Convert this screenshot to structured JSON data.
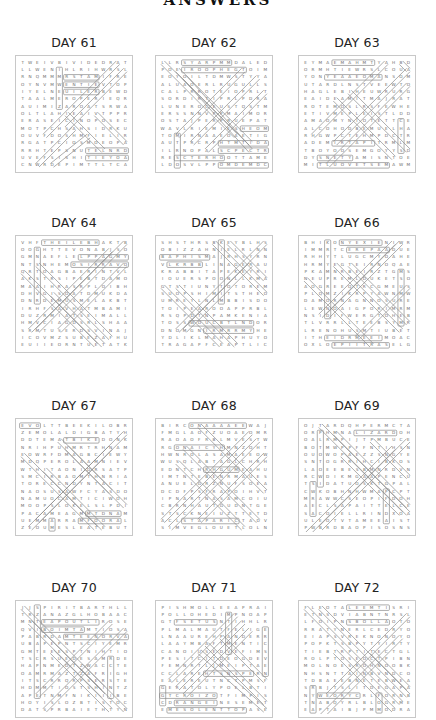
{
  "page": {
    "title": "ANSWERS"
  },
  "puzzles": [
    {
      "day": "DAY 61",
      "rows": [
        "TWEIVBIVIDEDRAT",
        "LLWENIHLRIHWRSL",
        "RNQMMMRSTAMIFRE",
        "OYNVMWENTIEVTOP",
        "IYELNEUILERBEWD",
        "TAALMEROPERIEQR",
        "AUIMIZAROATSRWA",
        "OLTLAHIEAIVTPPR",
        "ERASEICINOPOSEC",
        "MOTPCHSAHSIDRKU",
        "OUVFDOSHMFIELIR",
        "RGATPCIOSMOEOPA",
        "RRHTEPSNUTELNRD",
        "UVEFSISHITIEYOA",
        "CNWRDEPIMTTLTCA"
      ],
      "overlay": {
        "rects": [
          [
            5,
            1,
            5,
            6
          ],
          [
            6,
            2,
            10,
            2
          ],
          [
            6,
            3,
            10,
            3
          ],
          [
            6,
            4,
            10,
            4
          ],
          [
            9,
            12,
            14,
            12
          ],
          [
            9,
            13,
            14,
            13
          ]
        ],
        "diags": [
          [
            14,
            1,
            6,
            9
          ],
          [
            13,
            0,
            3,
            10
          ],
          [
            7,
            9,
            2,
            14
          ],
          [
            9,
            10,
            4,
            14
          ],
          [
            10,
            7,
            14,
            11
          ],
          [
            6,
            7,
            11,
            12
          ]
        ]
      }
    },
    {
      "day": "DAY 62",
      "rows": [
        "LLRSYARPMMDALED",
        "POEIROOPHEGTOIM",
        "EOYOILTDMWSTYYA",
        "ALUAOERLRUGULLS",
        "CALPRROTEIOPRLT",
        "SORDIRTIPRLPDRA",
        "LUNEROCEUSTQSTM",
        "ERSSNNVPPMAIMOR",
        "OSTAJPERPRUEPAT",
        "WAVLRIEMIESHEOM",
        "TOMIRNAAEOAETIG",
        "AUTPRCRPHTMTIDA",
        "ILRNOPALSCPECTR",
        "RESCTERHOOTTAME",
        "LDOSVLPPOMDEMDC"
      ],
      "overlay": {
        "rects": [
          [
            3,
            0,
            9,
            0
          ],
          [
            3,
            1,
            11,
            1
          ],
          [
            11,
            9,
            14,
            9
          ],
          [
            8,
            11,
            14,
            11
          ],
          [
            8,
            12,
            14,
            12
          ],
          [
            2,
            13,
            8,
            13
          ],
          [
            8,
            14,
            14,
            14
          ],
          [
            2,
            10,
            2,
            14
          ]
        ],
        "diags": [
          [
            0,
            0,
            10,
            10
          ],
          [
            2,
            1,
            12,
            11
          ],
          [
            3,
            2,
            12,
            12
          ],
          [
            11,
            1,
            2,
            10
          ],
          [
            13,
            2,
            4,
            11
          ],
          [
            14,
            4,
            6,
            12
          ]
        ]
      }
    },
    {
      "day": "DAY 63",
      "rows": [
        "EYMAEMAHMTYAHBD",
        "ORMHTIEWRSLCOUA",
        "YONYEAAEOMANSOM",
        "UTARDLNSTVEEWTO",
        "HAGLEBIHEUWRURG",
        "EAIDEAMITMAJRAT",
        "ROTEMOSLRSFEWHE",
        "ETIVMEPLEISTLDD",
        "AMAOMYNIOTETTCE",
        "ALCOHODBEMUELHA",
        "RHGWPCTEHMPDCTR",
        "ADEMIRTAPITRMLM",
        "TBOYOOSEMGOYYSD",
        "DYSNETYAMISNTOE",
        "MITLUOVETSEMAWM"
      ],
      "overlay": {
        "rects": [
          [
            4,
            0,
            9,
            0
          ],
          [
            3,
            2,
            10,
            2
          ],
          [
            4,
            11,
            9,
            11
          ],
          [
            2,
            13,
            6,
            13
          ],
          [
            2,
            14,
            11,
            14
          ],
          [
            13,
            8,
            13,
            12
          ]
        ],
        "diags": [
          [
            11,
            0,
            1,
            10
          ],
          [
            14,
            1,
            4,
            11
          ],
          [
            14,
            3,
            3,
            14
          ],
          [
            13,
            0,
            14,
            1
          ],
          [
            6,
            4,
            14,
            12
          ],
          [
            4,
            5,
            12,
            13
          ]
        ]
      }
    },
    {
      "day": "DAY 64",
      "rows": [
        "VHFTHEILEBHAKTB",
        "OOGHTTEVONABJSO",
        "GMNAEFLELPPAGMY",
        "NTSNHEMOSIRRAVO",
        "QRTOAGBAERINTVL",
        "AKSTRSIPEBTDAMO",
        "MAAIHRASRPLOIBH",
        "DHVGISOATDMUKDA",
        "DNRDEMUSMELAKBT",
        "IRHFSAVHATMBAMI",
        "DUZRMIATSEIMALL",
        "HMVCIAGDSRLSHAA",
        "SRMTUSERDSVINAJ",
        "ICOVMZSUBEZAFHU",
        "EUIIEORNTUETATK"
      ],
      "overlay": {
        "rects": [
          [
            3,
            0,
            10,
            0
          ],
          [
            8,
            2,
            14,
            2
          ],
          [
            2,
            1,
            2,
            8
          ],
          [
            7,
            3,
            14,
            3
          ]
        ],
        "diags": [
          [
            14,
            0,
            2,
            12
          ],
          [
            12,
            1,
            1,
            12
          ],
          [
            14,
            3,
            5,
            12
          ],
          [
            0,
            4,
            10,
            14
          ],
          [
            2,
            3,
            12,
            13
          ],
          [
            4,
            7,
            11,
            14
          ]
        ]
      }
    },
    {
      "day": "DAY 65",
      "rows": [
        "SHSTHRSBKEYBLHS",
        "OBIZZAHNIELRLNN",
        "BAPHISMAJRHSYRN",
        "VLKRBBLINAGERAU",
        "KRABBITAPEKEYRI",
        "IOUERSPOONLLKMA",
        "GTSTIUNYTOTOREM",
        "SUOPSHIMITSTHEO",
        "UMREYLNLMBBISDO",
        "TOIPEAROOAPPRBL",
        "RSQPDTNPAMKENIA",
        "TOSSWOUCBTLNDOR",
        "DNOMGNIRMRRMYHE",
        "YDLIKLMAHAPHUYO",
        "TRAGAPFCEAPTLIC"
      ],
      "overlay": {
        "rects": [
          [
            0,
            2,
            6,
            2
          ],
          [
            1,
            3,
            5,
            3
          ],
          [
            4,
            11,
            12,
            11
          ],
          [
            6,
            12,
            12,
            12
          ],
          [
            8,
            0,
            8,
            8
          ]
        ],
        "diags": [
          [
            7,
            0,
            14,
            7
          ],
          [
            9,
            0,
            14,
            5
          ],
          [
            14,
            0,
            2,
            12
          ],
          [
            12,
            3,
            3,
            12
          ],
          [
            0,
            6,
            8,
            14
          ],
          [
            2,
            6,
            10,
            14
          ]
        ]
      }
    },
    {
      "day": "DAY 66",
      "rows": [
        "BHIKONYEXIENIWR",
        "IMMRTCEREPAADUE",
        "RHHYTLUGCMYOAHE",
        "HRMYEGTEIRNOQAE",
        "PKAMNRBEIRZTGMS",
        "NEUPREMLDUKETSO",
        "AOGREEQTRCGMEUS",
        "PLQMZIKRPYAWNMW",
        "DAMORNAGNNOSURE",
        "LEWNOAIGPORIMRM",
        "NSIDIFWERGTOHEB",
        "TLVRRLLTEEBSYMR",
        "LRENOHUSMTIUBET",
        "ITHEIDRMEEIMOAC",
        "OXLOEPIITRASELG"
      ],
      "overlay": {
        "rects": [
          [
            5,
            0,
            10,
            0
          ],
          [
            3,
            0,
            3,
            10
          ],
          [
            6,
            1,
            11,
            1
          ],
          [
            13,
            4,
            13,
            11
          ],
          [
            3,
            13,
            10,
            13
          ],
          [
            4,
            14,
            11,
            14
          ]
        ],
        "diags": [
          [
            13,
            0,
            3,
            10
          ],
          [
            12,
            0,
            2,
            10
          ],
          [
            6,
            3,
            14,
            11
          ],
          [
            4,
            3,
            13,
            12
          ],
          [
            0,
            5,
            9,
            14
          ],
          [
            14,
            6,
            7,
            13
          ]
        ]
      }
    },
    {
      "day": "DAY 67",
      "rows": [
        "EVOLTTBEEKILOBR",
        "ZEMOLALDIGBATYH",
        "DDTEMATBIKEDONK",
        "NRIHPUHMRTRHNAM",
        "EOWRFDMAGBCIEWY",
        "MDQPEROLAAMNIEV",
        "WTHITAONIDRSATP",
        "SMCIRBAOMTHNRIA",
        "TORECCNDYNTACIT",
        "NAOSUSAWFCYASDO",
        "NAMUOCAMTICIWOH",
        "MOOPSLOKELSLPDI",
        "PACAMEAGMMTDNAM",
        "UEMMARRAMFOORAL",
        "ZEOUMESLEATEBUT"
      ],
      "overlay": {
        "rects": [
          [
            0,
            0,
            2,
            0
          ],
          [
            6,
            2,
            10,
            2
          ],
          [
            9,
            12,
            13,
            12
          ],
          [
            8,
            13,
            13,
            13
          ],
          [
            4,
            13,
            4,
            14
          ]
        ],
        "diags": [
          [
            5,
            2,
            14,
            11
          ],
          [
            6,
            3,
            12,
            9
          ],
          [
            14,
            1,
            2,
            13
          ],
          [
            12,
            3,
            1,
            14
          ],
          [
            3,
            6,
            11,
            14
          ],
          [
            0,
            4,
            10,
            14
          ]
        ]
      }
    },
    {
      "day": "DAY 68",
      "rows": [
        "BIRCONAAAAEEWAJ",
        "FMGLAOFZUOAEOMR",
        "RAOAOFRBLMVESTW",
        "RGONAICYHMNZOHT",
        "HWNROLASAMAEEOW",
        "WUSQLABTAGLCHRH",
        "EDNTCHRHGUMEAHU",
        "IMTNTEBENRMAUES",
        "ANUELGRZNUFSOEA",
        "DCDFPSFRAPOIHVT",
        "IPNARTNASAMCOIU",
        "CBRNHAUTGUDNTGE",
        "STSCKNEIUZTTETD",
        "ACLSTAPARICTADV",
        "SIMVEGLOUETLOLNE"
      ],
      "overlay": {
        "rects": [
          [
            2,
            3,
            8,
            3
          ],
          [
            4,
            0,
            11,
            0
          ],
          [
            3,
            13,
            10,
            13
          ],
          [
            6,
            6,
            10,
            6
          ]
        ],
        "diags": [
          [
            12,
            1,
            0,
            13
          ],
          [
            13,
            2,
            1,
            14
          ],
          [
            5,
            0,
            14,
            9
          ],
          [
            3,
            3,
            13,
            13
          ],
          [
            2,
            5,
            11,
            14
          ],
          [
            14,
            4,
            5,
            13
          ]
        ]
      }
    },
    {
      "day": "DAY 69",
      "rows": [
        "OJTARDQHPERMCTA",
        "ORPHMNALIZARDOH",
        "OALRMPIJTPMBUCE",
        "BOTMWPPFFNTIHSN",
        "OUOWOPAEZZSNGYE",
        "SNTOGRRIHCIBKOS",
        "LAOEEBESBMNRDVN",
        "RCWDIKMGAAPENCU",
        "TSIDATUOSKTGPAL",
        "CWKOBHNHWMAPCPT",
        "MRAWWCSEOPIFDOH",
        "AECLSAPAITTELCE",
        "SACOIELLRINDXOA",
        "ULEOTVTAMEEAIST",
        "PWBRDBAOPISOSNS"
      ],
      "overlay": {
        "rects": [
          [
            7,
            1,
            12,
            1
          ],
          [
            2,
            1,
            2,
            8
          ],
          [
            1,
            8,
            1,
            12
          ],
          [
            11,
            9,
            11,
            13
          ]
        ],
        "diags": [
          [
            2,
            0,
            14,
            12
          ],
          [
            4,
            1,
            14,
            11
          ],
          [
            14,
            2,
            2,
            14
          ],
          [
            12,
            3,
            0,
            15
          ],
          [
            5,
            4,
            13,
            12
          ],
          [
            9,
            2,
            14,
            7
          ]
        ]
      }
    },
    {
      "day": "DAY 70",
      "rows": [
        "JJSPIRITBARTHLL",
        "TRZANAZGLHOBAAC",
        "MNTEAPOUTLIROSE",
        "QVIBOIMTAMTIOSA",
        "PABRDAMTEENORVA",
        "UBAPEPNTSCIYEMR",
        "GMTEEESPTNIHTIO",
        "TSCRSUEDESAMRDE",
        "HAPNMEDTZWACCTE",
        "OAMRMAZTZAFRIGHE",
        "ITSCRRQRPSERSTE",
        "HDMMTIOSTSHINTZ",
        "APETNMFNIKIIIBER",
        "HOYISLOZBTISTOCT",
        "DATSPRBAIETHTYNG"
      ],
      "overlay": {
        "rects": [
          [
            3,
            2,
            10,
            2
          ],
          [
            3,
            3,
            8,
            3
          ],
          [
            6,
            4,
            14,
            4
          ],
          [
            2,
            0,
            2,
            12
          ],
          [
            12,
            7,
            12,
            12
          ]
        ],
        "diags": [
          [
            0,
            0,
            11,
            11
          ],
          [
            1,
            2,
            11,
            12
          ],
          [
            12,
            2,
            2,
            12
          ],
          [
            14,
            3,
            3,
            14
          ],
          [
            4,
            6,
            12,
            14
          ],
          [
            8,
            8,
            14,
            14
          ]
        ]
      }
    },
    {
      "day": "DAY 71",
      "rows": [
        "PISHMOLLEEAPRAI",
        "POLLOHEDIMPNOAP",
        "GTFSETUSNTIHHLR",
        "PLMALMAUTFELIGE",
        "LNAAUREHPANDERR",
        "LAAYMBAFTMENTIC",
        "CANOIUSEDVEFIMS",
        "PESITCITDEOGDEV",
        "FEMNRTLJMEIPTAE",
        "CCLAREHTSNSPERN",
        "EALEREUTNCTPMSF",
        "GERATOLYPOELBTIP",
        "GTCROIZOTFIMPIS",
        "CDRANGEINESEMET",
        "EMESOLENTTOPASE"
      ],
      "overlay": {
        "rects": [
          [
            2,
            2,
            7,
            2
          ],
          [
            9,
            1,
            9,
            6
          ],
          [
            6,
            9,
            12,
            9
          ],
          [
            0,
            12,
            7,
            12
          ],
          [
            2,
            13,
            7,
            13
          ],
          [
            1,
            14,
            11,
            14
          ],
          [
            0,
            11,
            0,
            13
          ],
          [
            14,
            3,
            14,
            9
          ]
        ],
        "diags": [
          [
            10,
            1,
            1,
            10
          ],
          [
            11,
            2,
            2,
            11
          ],
          [
            12,
            3,
            3,
            12
          ],
          [
            8,
            4,
            14,
            10
          ],
          [
            6,
            5,
            14,
            13
          ],
          [
            5,
            6,
            14,
            14
          ]
        ]
      }
    },
    {
      "day": "DAY 72",
      "rows": [
        "FLEOTALEEMTISRI",
        "ETNSDVIABNTNRSL",
        "LFOIPNSBOLLAOTO",
        "RRATYNERLCEDRYO",
        "EIAPSVREKNONOYO",
        "POPKTSBPYTYIRTY",
        "TIEBTRPTITECTGL",
        "ROLPTOSEOCTPIBN",
        "MOLNOESROHNOOBK",
        "NHSNTTAINBVNDCO",
        "TDBAEEBNETEBWEA",
        "SRBJTSLITDEGAPA",
        "NYWEORYCRLFORNB",
        "TNABQYRLBLOGRME",
        "EAPTAIBJPMMODRA"
      ],
      "overlay": {
        "rects": [
          [
            6,
            2,
            11,
            2
          ],
          [
            2,
            12,
            7,
            12
          ],
          [
            1,
            11,
            1,
            14
          ],
          [
            10,
            12,
            10,
            14
          ],
          [
            6,
            0,
            11,
            0
          ]
        ],
        "diags": [
          [
            0,
            0,
            13,
            13
          ],
          [
            2,
            0,
            14,
            12
          ],
          [
            14,
            1,
            3,
            12
          ],
          [
            13,
            4,
            2,
            15
          ],
          [
            4,
            6,
            12,
            14
          ],
          [
            9,
            6,
            14,
            11
          ]
        ]
      }
    }
  ]
}
